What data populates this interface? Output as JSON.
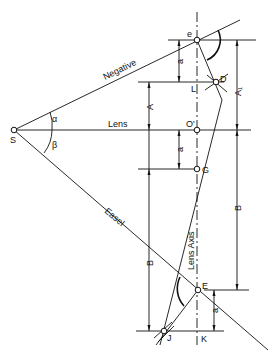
{
  "diagram": {
    "labels": {
      "negative": "Negative",
      "lens": "Lens",
      "easel": "Easel",
      "lens_axis": "Lens Axis",
      "S": "S",
      "e": "e",
      "D": "D",
      "L": "L",
      "O_prime": "O'",
      "G": "G",
      "E": "E",
      "J": "J",
      "K": "K",
      "alpha": "α",
      "beta": "β",
      "A": "A",
      "A1": "A₁",
      "B_left": "B",
      "B_right": "B",
      "a_top": "a",
      "a_mid": "a",
      "a_bottom": "a"
    }
  }
}
